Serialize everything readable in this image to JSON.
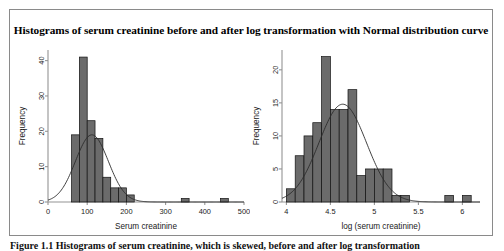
{
  "figure": {
    "title": "Histograms of serum creatinine before and after log transformation with Normal distribution curve",
    "caption": "Figure 1.1 Histograms of serum creatinine, which is skewed, before and after log transformation",
    "border_color": "#8a8a8a",
    "background": "#ffffff"
  },
  "style": {
    "bar_fill": "#6b6b6b",
    "bar_stroke": "#111111",
    "curve_color": "#2b2b2b",
    "axis_color": "#949494",
    "text_color": "#1a1a1a"
  },
  "chart_data": [
    {
      "type": "bar",
      "id": "serum-creatinine-histogram",
      "title": "",
      "xlabel": "Serum creatinine",
      "ylabel": "Frequency",
      "xlim": [
        0,
        500
      ],
      "ylim": [
        0,
        43
      ],
      "xticks": [
        0,
        100,
        200,
        300,
        400,
        500
      ],
      "xtick_labels": [
        "0",
        "100",
        "200",
        "300",
        "400",
        "500"
      ],
      "yticks": [
        0,
        10,
        20,
        30,
        40
      ],
      "ytick_labels": [
        "0",
        "10",
        "20",
        "30",
        "40"
      ],
      "grid": false,
      "legend": "none",
      "bin_width": 20,
      "bins": [
        {
          "x0": 60,
          "x1": 80,
          "count": 19
        },
        {
          "x0": 80,
          "x1": 100,
          "count": 41
        },
        {
          "x0": 100,
          "x1": 120,
          "count": 23
        },
        {
          "x0": 120,
          "x1": 140,
          "count": 18
        },
        {
          "x0": 140,
          "x1": 160,
          "count": 7
        },
        {
          "x0": 160,
          "x1": 180,
          "count": 4
        },
        {
          "x0": 180,
          "x1": 200,
          "count": 4
        },
        {
          "x0": 200,
          "x1": 220,
          "count": 2
        },
        {
          "x0": 340,
          "x1": 360,
          "count": 1
        },
        {
          "x0": 440,
          "x1": 460,
          "count": 1
        }
      ],
      "normal_curve": {
        "label": "Normal distribution curve",
        "mean": 112,
        "sd": 42,
        "peak_count": 19
      }
    },
    {
      "type": "bar",
      "id": "log-serum-creatinine-histogram",
      "title": "",
      "xlabel": "log (serum creatinine)",
      "ylabel": "Frequency",
      "xlim": [
        3.95,
        6.2
      ],
      "ylim": [
        0,
        23
      ],
      "xticks": [
        4,
        4.5,
        5,
        5.5,
        6
      ],
      "xtick_labels": [
        "4",
        "4.5",
        "5",
        "5.5",
        "6"
      ],
      "yticks": [
        0,
        5,
        10,
        15,
        20
      ],
      "ytick_labels": [
        "0",
        "5",
        "10",
        "15",
        "20"
      ],
      "grid": false,
      "legend": "none",
      "bin_width": 0.1,
      "bins": [
        {
          "x0": 4.0,
          "x1": 4.1,
          "count": 2
        },
        {
          "x0": 4.1,
          "x1": 4.2,
          "count": 7
        },
        {
          "x0": 4.2,
          "x1": 4.3,
          "count": 10
        },
        {
          "x0": 4.3,
          "x1": 4.4,
          "count": 12
        },
        {
          "x0": 4.4,
          "x1": 4.5,
          "count": 22
        },
        {
          "x0": 4.5,
          "x1": 4.6,
          "count": 14
        },
        {
          "x0": 4.6,
          "x1": 4.7,
          "count": 14
        },
        {
          "x0": 4.7,
          "x1": 4.8,
          "count": 17
        },
        {
          "x0": 4.8,
          "x1": 4.9,
          "count": 4
        },
        {
          "x0": 4.9,
          "x1": 5.0,
          "count": 5
        },
        {
          "x0": 5.0,
          "x1": 5.1,
          "count": 5
        },
        {
          "x0": 5.1,
          "x1": 5.2,
          "count": 5
        },
        {
          "x0": 5.2,
          "x1": 5.3,
          "count": 1
        },
        {
          "x0": 5.3,
          "x1": 5.4,
          "count": 1
        },
        {
          "x0": 5.8,
          "x1": 5.9,
          "count": 1
        },
        {
          "x0": 6.0,
          "x1": 6.1,
          "count": 1
        }
      ],
      "normal_curve": {
        "label": "Normal distribution curve",
        "mean": 4.64,
        "sd": 0.27,
        "peak_count": 14.8
      }
    }
  ]
}
